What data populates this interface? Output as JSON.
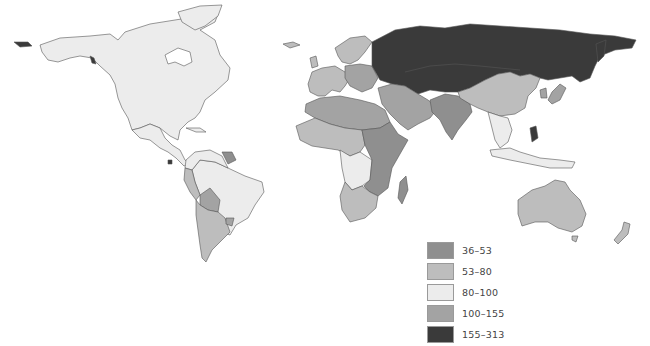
{
  "map": {
    "type": "choropleth world map",
    "colors": {
      "c36_53": "#8f8f8f",
      "c53_80": "#bdbdbd",
      "c80_100": "#ececec",
      "c100_155": "#a3a3a3",
      "c155_313": "#3a3a3a",
      "border": "#555555"
    }
  },
  "legend": {
    "items": [
      {
        "label": "36–53",
        "color": "#8f8f8f"
      },
      {
        "label": "53–80",
        "color": "#bdbdbd"
      },
      {
        "label": "80–100",
        "color": "#ececec"
      },
      {
        "label": "100–155",
        "color": "#a3a3a3"
      },
      {
        "label": "155–313",
        "color": "#3a3a3a"
      }
    ]
  }
}
